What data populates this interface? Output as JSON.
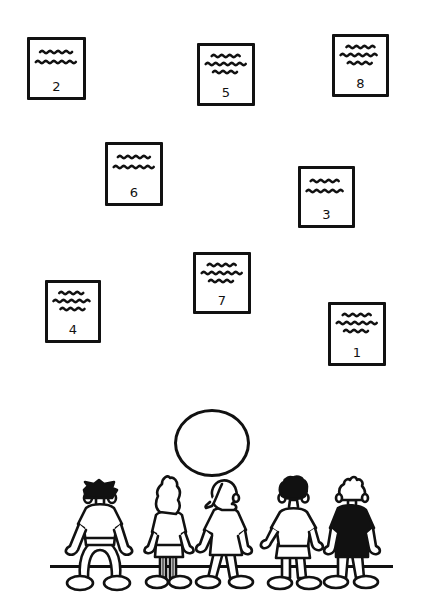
{
  "scene": {
    "width": 428,
    "height": 603,
    "ink_color": "#111111",
    "background": "#ffffff"
  },
  "cards": [
    {
      "label": "2",
      "x": 27,
      "y": 37,
      "w": 59,
      "h": 63,
      "lines": 2
    },
    {
      "label": "5",
      "x": 197,
      "y": 43,
      "w": 58,
      "h": 63,
      "lines": 3
    },
    {
      "label": "8",
      "x": 332,
      "y": 34,
      "w": 57,
      "h": 63,
      "lines": 3
    },
    {
      "label": "6",
      "x": 105,
      "y": 142,
      "w": 58,
      "h": 64,
      "lines": 2
    },
    {
      "label": "3",
      "x": 298,
      "y": 166,
      "w": 57,
      "h": 62,
      "lines": 2
    },
    {
      "label": "7",
      "x": 193,
      "y": 252,
      "w": 58,
      "h": 62,
      "lines": 3
    },
    {
      "label": "4",
      "x": 45,
      "y": 280,
      "w": 56,
      "h": 63,
      "lines": 3
    },
    {
      "label": "1",
      "x": 328,
      "y": 302,
      "w": 58,
      "h": 64,
      "lines": 3
    }
  ],
  "ball": {
    "cx": 212,
    "cy": 443,
    "rx": 38,
    "ry": 34
  },
  "ground": {
    "x1": 50,
    "x2": 393,
    "y": 565
  },
  "children": [
    {
      "id": "child-1",
      "hair": "dark-spiky",
      "shirt": "white",
      "pose": "bowed-legs"
    },
    {
      "id": "child-2",
      "hair": "long-curly-outline",
      "shirt": "white",
      "pose": "standing"
    },
    {
      "id": "child-3",
      "hair": "ponytail-outline",
      "shirt": "white",
      "pose": "standing"
    },
    {
      "id": "child-4",
      "hair": "dark-curly",
      "shirt": "white",
      "pose": "standing"
    },
    {
      "id": "child-5",
      "hair": "tuft-outline",
      "shirt": "black",
      "pose": "standing"
    }
  ]
}
